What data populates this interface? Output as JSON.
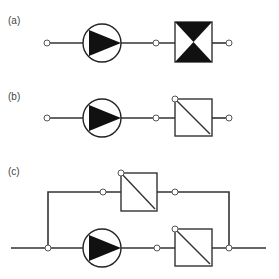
{
  "diagram": {
    "type": "pump-circuit-schematics",
    "colors": {
      "line": "#333333",
      "fill": "#111111",
      "background": "#ffffff"
    },
    "panels": [
      {
        "id": "a",
        "label": "(a)",
        "components": [
          "node",
          "pump",
          "node",
          "valve-hourglass",
          "node"
        ]
      },
      {
        "id": "b",
        "label": "(b)",
        "components": [
          "node",
          "pump",
          "node",
          "filter-diagonal",
          "node"
        ]
      },
      {
        "id": "c",
        "label": "(c)",
        "components": [
          "line-in",
          "junction-node",
          "pump",
          "node",
          "filter-diagonal",
          "junction-node",
          "line-out"
        ],
        "bypass": [
          "node",
          "filter-diagonal",
          "node"
        ]
      }
    ]
  }
}
